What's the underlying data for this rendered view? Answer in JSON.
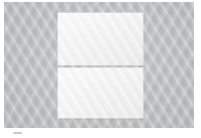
{
  "image": {
    "kind": "photo-crop",
    "description": "Low-resolution grayscale photo crop: two stacked pale rectangular panels centered on a textured gray background",
    "width": 201,
    "height": 138,
    "background_color": "#ffffff"
  },
  "backdrop": {
    "name": "gray backing surface",
    "color": "#b9babc",
    "texture": "diagonal weave moire",
    "left": 4,
    "top": 2,
    "width": 190,
    "height": 126
  },
  "panels": [
    {
      "name": "upper panel",
      "color": "#f3f3f4",
      "left": 58,
      "top": 13,
      "width": 85,
      "height": 52
    },
    {
      "name": "lower panel",
      "color": "#f3f3f4",
      "left": 58,
      "top": 68,
      "width": 85,
      "height": 50
    }
  ],
  "divider": {
    "name": "gap between panels",
    "color": "#b9babc",
    "top": 65,
    "height": 3
  },
  "artifact": {
    "name": "faint mark below backdrop",
    "color": "#9a9a9c",
    "left": 13,
    "top": 132,
    "width": 9,
    "height": 2
  }
}
